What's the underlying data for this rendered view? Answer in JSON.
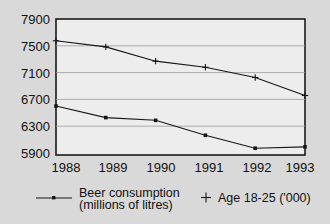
{
  "chart_data": {
    "type": "line",
    "title": "",
    "subtitle": "",
    "xlabel": "",
    "ylabel": "",
    "categories": [
      "1988",
      "1989",
      "1990",
      "1991",
      "1992",
      "1993"
    ],
    "x": [
      1988,
      1989,
      1990,
      1991,
      1992,
      1993
    ],
    "series": [
      {
        "name": "Age 18-25 ('000)",
        "marker": "cross",
        "values": [
          7580,
          7490,
          7280,
          7190,
          7040,
          6775
        ]
      },
      {
        "name": "Beer consumption (millions of litres)",
        "marker": "dot",
        "values": [
          6620,
          6450,
          6410,
          6190,
          6000,
          6020
        ]
      }
    ],
    "ylim": [
      5900,
      7900
    ],
    "ytick_values": [
      5900,
      6300,
      6700,
      7100,
      7500,
      7900
    ],
    "ytick_labels": [
      "5900",
      "6300",
      "6700",
      "7100",
      "7500",
      "7900"
    ],
    "xtick_labels": [
      "1988",
      "1989",
      "1990",
      "1991",
      "1992",
      "1993"
    ],
    "grid": true,
    "legend_position": "bottom"
  },
  "legend": {
    "entries": [
      {
        "marker": "dot",
        "line1": "Beer consumption",
        "line2": "(millions of litres)"
      },
      {
        "marker": "cross",
        "line1": "Age 18-25 ('000)",
        "line2": ""
      }
    ]
  },
  "colors": {
    "background": "#d9d9d9",
    "plot_background": "#ededed",
    "axis": "#1a1a1a",
    "gridline": "#9a9a9a",
    "series": "#161616",
    "text": "#111111"
  }
}
